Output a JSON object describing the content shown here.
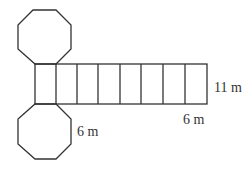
{
  "figure": {
    "labels": {
      "height": "11 m",
      "rect_width": "6 m",
      "octagon_side": "6 m"
    },
    "rectangle_count": 8,
    "octagon_count": 2,
    "stroke_color": "#333333"
  }
}
